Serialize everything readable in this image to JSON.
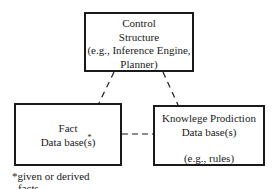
{
  "nodes": {
    "control": {
      "lines": [
        "Control",
        "Structure",
        "(e.g., Inference Engine,",
        "Planner)"
      ]
    },
    "fact": {
      "line1": "Fact",
      "line2_prefix": "Data base(",
      "line2_mark": "s",
      "line2_star": "*",
      "line2_suffix": ")"
    },
    "knowledge": {
      "lines": [
        "Knowlege Prodiction",
        "Data base(s)",
        "(e.g., rules)"
      ]
    }
  },
  "edges": [
    {
      "from": "control",
      "to": "fact",
      "style": "dashed"
    },
    {
      "from": "control",
      "to": "knowledge",
      "style": "dashed"
    },
    {
      "from": "fact",
      "to": "knowledge",
      "style": "dashed"
    }
  ],
  "footnote": {
    "line1": "*given or derived",
    "line2": "facts"
  }
}
